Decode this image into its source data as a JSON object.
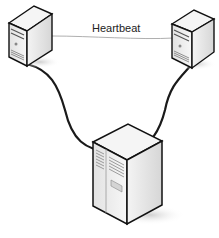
{
  "diagram": {
    "type": "network-cluster",
    "nodes": [
      {
        "id": "server-left",
        "kind": "tower-server"
      },
      {
        "id": "server-right",
        "kind": "tower-server"
      },
      {
        "id": "shared-storage",
        "kind": "storage-cabinet"
      }
    ],
    "edges": [
      {
        "from": "server-left",
        "to": "server-right",
        "label": "Heartbeat",
        "style": "thin"
      },
      {
        "from": "server-left",
        "to": "shared-storage",
        "style": "thick"
      },
      {
        "from": "server-right",
        "to": "shared-storage",
        "style": "thick"
      }
    ],
    "heartbeat_label": "Heartbeat"
  }
}
